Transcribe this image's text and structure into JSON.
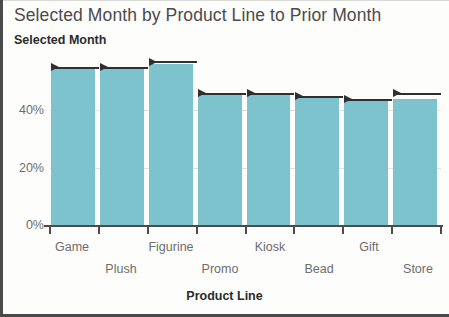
{
  "chart_data": {
    "type": "bar",
    "title": "Selected Month by Product Line to Prior Month",
    "subtitle": "Selected Month",
    "xlabel": "Product Line",
    "ylabel": "",
    "categories": [
      "Game",
      "Plush",
      "Figurine",
      "Promo",
      "Kiosk",
      "Bead",
      "Gift",
      "Store"
    ],
    "values": [
      55,
      55,
      56,
      46,
      46,
      45,
      44,
      44
    ],
    "reference_series": {
      "name": "Prior Month",
      "values": [
        55,
        55,
        57,
        46,
        46,
        45,
        44,
        46
      ]
    },
    "ytick_labels": [
      "0%",
      "20%",
      "40%"
    ],
    "ytick_values": [
      0,
      20,
      40
    ],
    "ylim": [
      0,
      60
    ],
    "grid": true,
    "legend": "none",
    "bar_color": "#7cc3cd",
    "reference_color": "#2f2f2f",
    "axis_color": "#4c4c4c",
    "grid_color": "#e2e2de"
  },
  "axis": {
    "x_title": "Product Line",
    "y_ticks": [
      {
        "label": "40%",
        "top": 103
      },
      {
        "label": "20%",
        "top": 161
      },
      {
        "label": "0%",
        "top": 218
      }
    ],
    "x_ticks": [
      {
        "label": "Game",
        "center": 72,
        "row": 0
      },
      {
        "label": "Plush",
        "center": 121,
        "row": 1
      },
      {
        "label": "Figurine",
        "center": 171,
        "row": 0
      },
      {
        "label": "Promo",
        "center": 220,
        "row": 1
      },
      {
        "label": "Kiosk",
        "center": 270,
        "row": 0
      },
      {
        "label": "Bead",
        "center": 319,
        "row": 1
      },
      {
        "label": "Gift",
        "center": 369,
        "row": 0
      },
      {
        "label": "Store",
        "center": 418,
        "row": 1
      }
    ]
  },
  "header": {
    "title": "Selected Month by Product Line to Prior Month",
    "subtitle": "Selected Month"
  }
}
